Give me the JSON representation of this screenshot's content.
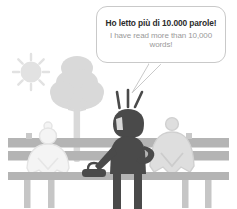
{
  "illustration": {
    "title": "Park bench scene with speech bubble",
    "background_color": "#ffffff"
  },
  "speech_bubble": {
    "primary_text": "Ho letto più di 10.000 parole!",
    "secondary_text": "I have read more than 10,000 words!",
    "primary_color": "#2b2b2b",
    "secondary_color": "#9a9a9a",
    "border_color": "#c9c9c9",
    "fill_color": "#ffffff"
  },
  "figures": {
    "standing": {
      "name": "standing-person",
      "color": "#4a4a4a",
      "emphasis_marks": 3
    },
    "seated_left": {
      "name": "seated-person-left",
      "color": "#f2f2f2",
      "outline": "#e2e2e2"
    },
    "seated_right": {
      "name": "seated-person-right",
      "color": "#dcdcdc",
      "outline": "#cfcfcf"
    }
  },
  "props": {
    "bench": {
      "color": "#b4b4b4",
      "leg_color": "#c4c4c4",
      "slats": 3
    },
    "bag": {
      "color": "#4a4a4a"
    },
    "tree": {
      "color": "#d8d8d8"
    },
    "sun": {
      "color": "#e0e0e0",
      "rays": 8
    }
  }
}
